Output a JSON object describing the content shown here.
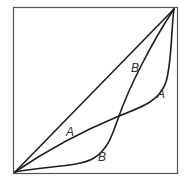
{
  "diagram": {
    "type": "lorenz-style curves in unit square",
    "curves": [
      {
        "id": "diagonal",
        "label": ""
      },
      {
        "id": "A",
        "label": "A"
      },
      {
        "id": "B",
        "label": "B"
      }
    ],
    "labels": {
      "b_upper": "B",
      "a_right": "A",
      "a_lower": "A",
      "b_lower": "B"
    },
    "colors": {
      "line": "#1e1e1e",
      "frame": "#555555",
      "label": "#333333"
    }
  }
}
